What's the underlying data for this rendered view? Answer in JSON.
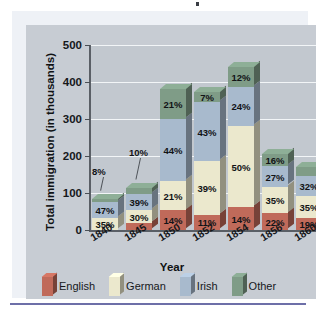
{
  "chart_data": {
    "type": "bar",
    "subtype": "stacked-percentage-3d",
    "title": "",
    "xlabel": "Year",
    "ylabel": "Total immigration (in thousands)",
    "ylim": [
      0,
      500
    ],
    "yticks": [
      0,
      100,
      200,
      300,
      400,
      500
    ],
    "grid": true,
    "legend_position": "bottom",
    "categories": [
      "1840",
      "1845",
      "1850",
      "1852",
      "1854",
      "1856",
      "1860"
    ],
    "stack_order_bottom_to_top": [
      "English",
      "German",
      "Irish",
      "Other"
    ],
    "series": [
      {
        "name": "English",
        "color": "#c06a5a",
        "values": [
          null,
          17,
          14,
          11,
          14,
          22,
          19
        ],
        "labels": [
          "",
          "17%",
          "14%",
          "11%",
          "14%",
          "22%",
          "19%"
        ]
      },
      {
        "name": "German",
        "color": "#ebe8cd",
        "values": [
          35,
          30,
          21,
          39,
          50,
          35,
          35
        ],
        "labels": [
          "35%",
          "30%",
          "21%",
          "39%",
          "50%",
          "35%",
          "35%"
        ]
      },
      {
        "name": "Irish",
        "color": "#a8bacd",
        "values": [
          47,
          39,
          44,
          43,
          24,
          27,
          32
        ],
        "labels": [
          "47%",
          "39%",
          "44%",
          "43%",
          "24%",
          "27%",
          "32%"
        ]
      },
      {
        "name": "Other",
        "color": "#7f9c87",
        "values": [
          8,
          14,
          21,
          7,
          12,
          16,
          14
        ],
        "labels": [
          "8%",
          "14%",
          "21%",
          "7%",
          "12%",
          "16%",
          "14%"
        ]
      }
    ],
    "bar_totals_thousands": [
      92,
      114,
      380,
      372,
      440,
      205,
      170
    ],
    "callouts": [
      {
        "year": "1840",
        "label": "10%"
      },
      {
        "year": "1845",
        "label": "8%"
      }
    ]
  },
  "legend": {
    "items": [
      {
        "label": "English",
        "color": "#c06a5a",
        "icon": "legend-swatch-english"
      },
      {
        "label": "German",
        "color": "#ebe8cd",
        "icon": "legend-swatch-german"
      },
      {
        "label": "Irish",
        "color": "#a8bacd",
        "icon": "legend-swatch-irish"
      },
      {
        "label": "Other",
        "color": "#7f9c87",
        "icon": "legend-swatch-other"
      }
    ]
  },
  "axes": {
    "y_title": "Total immigration (in thousands)",
    "x_title": "Year",
    "y_ticks": [
      "500",
      "400",
      "300",
      "200",
      "100",
      "0"
    ],
    "x_ticks": [
      "1840",
      "1845",
      "1850",
      "1852",
      "1854",
      "1856",
      "1860"
    ]
  },
  "bars": [
    {
      "year": "1840",
      "total": 92,
      "segments": [
        {
          "series": "German",
          "label": "35%",
          "value": 35
        },
        {
          "series": "Irish",
          "label": "47%",
          "value": 47
        },
        {
          "series": "Other",
          "label": "8%",
          "value": 8
        }
      ]
    },
    {
      "year": "1845",
      "total": 114,
      "segments": [
        {
          "series": "English",
          "label": "17%",
          "value": 17
        },
        {
          "series": "German",
          "label": "30%",
          "value": 30
        },
        {
          "series": "Irish",
          "label": "39%",
          "value": 39
        },
        {
          "series": "Other",
          "label": "14%",
          "value": 14
        }
      ]
    },
    {
      "year": "1850",
      "total": 380,
      "segments": [
        {
          "series": "English",
          "label": "14%",
          "value": 14
        },
        {
          "series": "German",
          "label": "21%",
          "value": 21
        },
        {
          "series": "Irish",
          "label": "44%",
          "value": 44
        },
        {
          "series": "Other",
          "label": "21%",
          "value": 21
        }
      ]
    },
    {
      "year": "1852",
      "total": 372,
      "segments": [
        {
          "series": "English",
          "label": "11%",
          "value": 11
        },
        {
          "series": "German",
          "label": "39%",
          "value": 39
        },
        {
          "series": "Irish",
          "label": "43%",
          "value": 43
        },
        {
          "series": "Other",
          "label": "7%",
          "value": 7
        }
      ]
    },
    {
      "year": "1854",
      "total": 440,
      "segments": [
        {
          "series": "English",
          "label": "14%",
          "value": 14
        },
        {
          "series": "German",
          "label": "50%",
          "value": 50
        },
        {
          "series": "Irish",
          "label": "24%",
          "value": 24
        },
        {
          "series": "Other",
          "label": "12%",
          "value": 12
        }
      ]
    },
    {
      "year": "1856",
      "total": 205,
      "segments": [
        {
          "series": "English",
          "label": "22%",
          "value": 22
        },
        {
          "series": "German",
          "label": "35%",
          "value": 35
        },
        {
          "series": "Irish",
          "label": "27%",
          "value": 27
        },
        {
          "series": "Other",
          "label": "16%",
          "value": 16
        }
      ]
    },
    {
      "year": "1860",
      "total": 170,
      "segments": [
        {
          "series": "English",
          "label": "19%",
          "value": 19
        },
        {
          "series": "German",
          "label": "35%",
          "value": 35
        },
        {
          "series": "Irish",
          "label": "32%",
          "value": 32
        },
        {
          "series": "Other",
          "label": "14%",
          "value": 14
        }
      ]
    }
  ],
  "callouts": [
    {
      "label": "8%"
    },
    {
      "label": "10%"
    }
  ],
  "colors": {
    "plot_background": "#c2c8cf",
    "card_background": "#c7ccd3",
    "panel_background": "#eef1f6",
    "gridline": "#f2f5f7",
    "axis": "#5a5f66",
    "rule": "#6d6fa8"
  }
}
